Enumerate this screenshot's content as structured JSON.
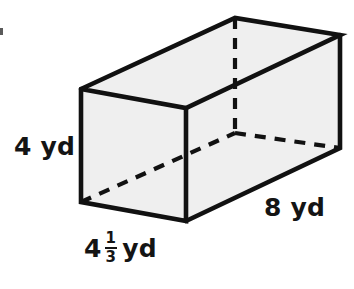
{
  "figure": {
    "name": "rectangular-prism-diagram",
    "shape_type": "rectangular prism",
    "fill_color": "#efefef",
    "stroke_color": "#111111",
    "background_color": "#ffffff"
  },
  "labels": {
    "height": "4 yd",
    "depth": "8 yd",
    "width": {
      "whole": "4",
      "numerator": "1",
      "denominator": "3",
      "unit": "yd",
      "full_text": "4 1/3 yd"
    }
  },
  "geometry": {
    "front_top_left": [
      81,
      89
    ],
    "front_top_right": [
      186,
      108
    ],
    "front_bottom_left": [
      81,
      202
    ],
    "front_bottom_right": [
      186,
      221
    ],
    "back_top_left": [
      235,
      18
    ],
    "back_top_right": [
      340,
      35
    ],
    "back_bottom_left_hidden": [
      235,
      133
    ],
    "back_bottom_right": [
      340,
      148
    ]
  }
}
